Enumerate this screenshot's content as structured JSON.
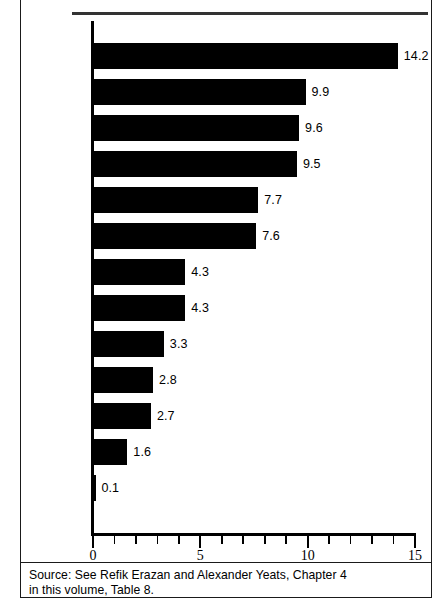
{
  "figure": {
    "source_note_line1": "Source: See Refik Erazan and Alexander Yeats, Chapter 4",
    "source_note_line2": "in this volume, Table 8."
  },
  "chart_data": {
    "type": "bar",
    "orientation": "horizontal",
    "title": "",
    "xlabel": "",
    "ylabel": "",
    "xlim": [
      0,
      15
    ],
    "xticks": [
      0,
      5,
      10,
      15
    ],
    "xtick_labels": [
      "0",
      "5",
      "10",
      "15"
    ],
    "minor_tick_interval": 1,
    "grid": false,
    "legend": false,
    "bar_color": "#000000",
    "background_color": "#ffffff",
    "categories": [
      "Brazil",
      "Uruguay",
      "Mexico",
      "Paraguay",
      "Argentina",
      "CACM",
      "Caricom",
      "Colombia",
      "Peru",
      "Chile",
      "Bolivia",
      "Venezuela",
      "Ecuador"
    ],
    "values": [
      14.2,
      9.9,
      9.6,
      9.5,
      7.7,
      7.6,
      4.3,
      4.3,
      3.3,
      2.8,
      2.7,
      1.6,
      0.1
    ],
    "value_labels": [
      "14.2",
      "9.9",
      "9.6",
      "9.5",
      "7.7",
      "7.6",
      "4.3",
      "4.3",
      "3.3",
      "2.8",
      "2.7",
      "1.6",
      "0.1"
    ]
  }
}
